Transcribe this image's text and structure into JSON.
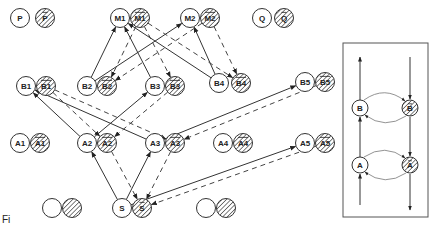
{
  "diagram": {
    "type": "graph",
    "style": {
      "line_color": "#333333",
      "hatch_color": "#555555",
      "background": "#ffffff"
    },
    "nodes": [
      {
        "id": "P",
        "label": "P",
        "x": 20,
        "y": 18,
        "negated": false
      },
      {
        "id": "Pn",
        "label": "P",
        "x": 45,
        "y": 18,
        "negated": true
      },
      {
        "id": "M1",
        "label": "M1",
        "x": 120,
        "y": 18,
        "negated": false
      },
      {
        "id": "M1n",
        "label": "M1",
        "x": 140,
        "y": 18,
        "negated": true
      },
      {
        "id": "M2",
        "label": "M2",
        "x": 190,
        "y": 18,
        "negated": false
      },
      {
        "id": "M2n",
        "label": "M2",
        "x": 210,
        "y": 18,
        "negated": true
      },
      {
        "id": "Q",
        "label": "Q",
        "x": 262,
        "y": 18,
        "negated": false
      },
      {
        "id": "Qn",
        "label": "Q",
        "x": 284,
        "y": 18,
        "negated": true
      },
      {
        "id": "B1",
        "label": "B1",
        "x": 26,
        "y": 86,
        "negated": false
      },
      {
        "id": "B1n",
        "label": "B1",
        "x": 46,
        "y": 86,
        "negated": true
      },
      {
        "id": "B2",
        "label": "B2",
        "x": 87,
        "y": 86,
        "negated": false
      },
      {
        "id": "B2n",
        "label": "B2",
        "x": 107,
        "y": 86,
        "negated": true
      },
      {
        "id": "B3",
        "label": "B3",
        "x": 155,
        "y": 86,
        "negated": false
      },
      {
        "id": "B3n",
        "label": "B3",
        "x": 175,
        "y": 86,
        "negated": true
      },
      {
        "id": "B4",
        "label": "B4",
        "x": 219,
        "y": 83,
        "negated": false
      },
      {
        "id": "B4n",
        "label": "B4",
        "x": 241,
        "y": 83,
        "negated": true
      },
      {
        "id": "B5",
        "label": "B5",
        "x": 305,
        "y": 82,
        "negated": false
      },
      {
        "id": "B5n",
        "label": "B5",
        "x": 325,
        "y": 82,
        "negated": true
      },
      {
        "id": "A1",
        "label": "A1",
        "x": 20,
        "y": 143,
        "negated": false
      },
      {
        "id": "A1n",
        "label": "A1",
        "x": 40,
        "y": 143,
        "negated": true
      },
      {
        "id": "A2",
        "label": "A2",
        "x": 87,
        "y": 143,
        "negated": false
      },
      {
        "id": "A2n",
        "label": "A2",
        "x": 107,
        "y": 143,
        "negated": true
      },
      {
        "id": "A3",
        "label": "A3",
        "x": 155,
        "y": 143,
        "negated": false
      },
      {
        "id": "A3n",
        "label": "A3",
        "x": 175,
        "y": 143,
        "negated": true
      },
      {
        "id": "A4",
        "label": "A4",
        "x": 223,
        "y": 143,
        "negated": false
      },
      {
        "id": "A4n",
        "label": "A4",
        "x": 243,
        "y": 143,
        "negated": true
      },
      {
        "id": "A5",
        "label": "A5",
        "x": 305,
        "y": 143,
        "negated": false
      },
      {
        "id": "A5n",
        "label": "A5",
        "x": 325,
        "y": 143,
        "negated": true
      },
      {
        "id": "E1",
        "label": "",
        "x": 52,
        "y": 208,
        "negated": false
      },
      {
        "id": "E1n",
        "label": "",
        "x": 72,
        "y": 208,
        "negated": true
      },
      {
        "id": "S",
        "label": "S",
        "x": 122,
        "y": 208,
        "negated": false
      },
      {
        "id": "Sn",
        "label": "S",
        "x": 142,
        "y": 208,
        "negated": true
      },
      {
        "id": "E2",
        "label": "",
        "x": 206,
        "y": 208,
        "negated": false
      },
      {
        "id": "E2n",
        "label": "",
        "x": 226,
        "y": 208,
        "negated": true
      }
    ],
    "edges_solid": [
      {
        "from": "B2",
        "to": "M1"
      },
      {
        "from": "B3",
        "to": "M1"
      },
      {
        "from": "B4",
        "to": "M1"
      },
      {
        "from": "B2",
        "to": "M2"
      },
      {
        "from": "B4",
        "to": "M2"
      },
      {
        "from": "A2",
        "to": "B1"
      },
      {
        "from": "A3",
        "to": "B1"
      },
      {
        "from": "A2",
        "to": "B3"
      },
      {
        "from": "A3",
        "to": "B5"
      },
      {
        "from": "S",
        "to": "A2"
      },
      {
        "from": "S",
        "to": "A3"
      },
      {
        "from": "S",
        "to": "A5"
      }
    ],
    "edges_dashed": [
      {
        "from": "M1n",
        "to": "B2n"
      },
      {
        "from": "M1n",
        "to": "B3n"
      },
      {
        "from": "M1n",
        "to": "B4n"
      },
      {
        "from": "M2n",
        "to": "B2n"
      },
      {
        "from": "M2n",
        "to": "B4n"
      },
      {
        "from": "B1n",
        "to": "A2n"
      },
      {
        "from": "B1n",
        "to": "A3n"
      },
      {
        "from": "B3n",
        "to": "A2n"
      },
      {
        "from": "B5n",
        "to": "A3n"
      },
      {
        "from": "A2n",
        "to": "Sn"
      },
      {
        "from": "A3n",
        "to": "Sn"
      },
      {
        "from": "A5n",
        "to": "Sn"
      }
    ],
    "legend": {
      "nodes": [
        {
          "id": "LB",
          "label": "B",
          "x": 360,
          "y": 108,
          "negated": false
        },
        {
          "id": "LBn",
          "label": "B",
          "x": 410,
          "y": 108,
          "negated": true
        },
        {
          "id": "LA",
          "label": "A",
          "x": 360,
          "y": 165,
          "negated": false
        },
        {
          "id": "LAn",
          "label": "A",
          "x": 410,
          "y": 165,
          "negated": true
        }
      ]
    },
    "caption": "Fi"
  }
}
